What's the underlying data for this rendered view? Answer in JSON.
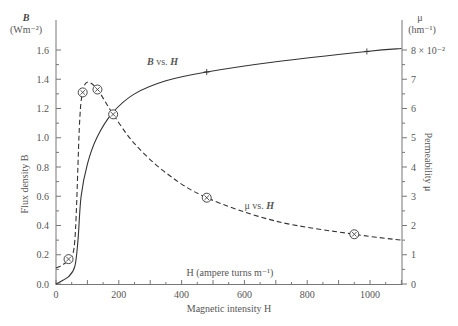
{
  "chart_data": {
    "type": "line",
    "title": "",
    "xlabel": "Magnetic intensity H",
    "xlabel_inner": "H (ampere turns m⁻¹)",
    "ylabel_left": "Flux density B",
    "ylabel_left_unit_symbol": "B",
    "ylabel_left_unit": "(Wm⁻²)",
    "ylabel_right": "Permeability μ",
    "ylabel_right_unit_symbol": "μ",
    "ylabel_right_unit": "(hm⁻¹)",
    "xlim": [
      0,
      1100
    ],
    "ylim_left": [
      0.0,
      1.6
    ],
    "ylim_right": [
      0,
      8
    ],
    "x_ticks": [
      "0",
      "200",
      "400",
      "600",
      "800",
      "1000"
    ],
    "y_left_ticks": [
      "0.0",
      "0.2",
      "0.4",
      "0.6",
      "0.8",
      "1.0",
      "1.2",
      "1.4",
      "1.6"
    ],
    "y_right_ticks": [
      "0",
      "1",
      "2",
      "3",
      "4",
      "5",
      "6",
      "7",
      "8 × 10⁻²"
    ],
    "grid": false,
    "series": [
      {
        "name": "B vs. H",
        "label_symbol": "B",
        "axis": "left",
        "style": "solid",
        "x": [
          0,
          40,
          60,
          70,
          80,
          100,
          130,
          180,
          250,
          350,
          480,
          700,
          990,
          1100
        ],
        "values": [
          0.0,
          0.05,
          0.12,
          0.3,
          0.6,
          0.82,
          1.0,
          1.17,
          1.3,
          1.39,
          1.45,
          1.52,
          1.59,
          1.61
        ],
        "markers": [
          {
            "x": 480,
            "y": 1.45,
            "shape": "plus"
          },
          {
            "x": 990,
            "y": 1.59,
            "shape": "plus"
          }
        ]
      },
      {
        "name": "μ vs. H",
        "label_symbol": "H",
        "axis": "right",
        "style": "dashed",
        "x": [
          0,
          20,
          40,
          60,
          75,
          85,
          100,
          132,
          182,
          250,
          350,
          480,
          700,
          950,
          1100
        ],
        "values": [
          0.55,
          0.65,
          0.85,
          1.5,
          5.5,
          6.55,
          6.9,
          6.65,
          5.8,
          4.8,
          3.8,
          2.95,
          2.15,
          1.7,
          1.5
        ],
        "markers": [
          {
            "x": 40,
            "y": 0.85,
            "shape": "circle-x"
          },
          {
            "x": 85,
            "y": 6.55,
            "shape": "circle-x"
          },
          {
            "x": 132,
            "y": 6.65,
            "shape": "circle-x"
          },
          {
            "x": 182,
            "y": 5.8,
            "shape": "circle-x"
          },
          {
            "x": 480,
            "y": 2.95,
            "shape": "circle-x"
          },
          {
            "x": 950,
            "y": 1.7,
            "shape": "circle-x"
          }
        ]
      }
    ],
    "annotations": [
      {
        "text": "B vs. H",
        "x": 290,
        "y": 1.48
      },
      {
        "text": "μ vs. H",
        "x": 600,
        "y": 2.55
      }
    ],
    "colors": {
      "line": "#333333",
      "axis": "#777777",
      "text": "#555555"
    }
  }
}
